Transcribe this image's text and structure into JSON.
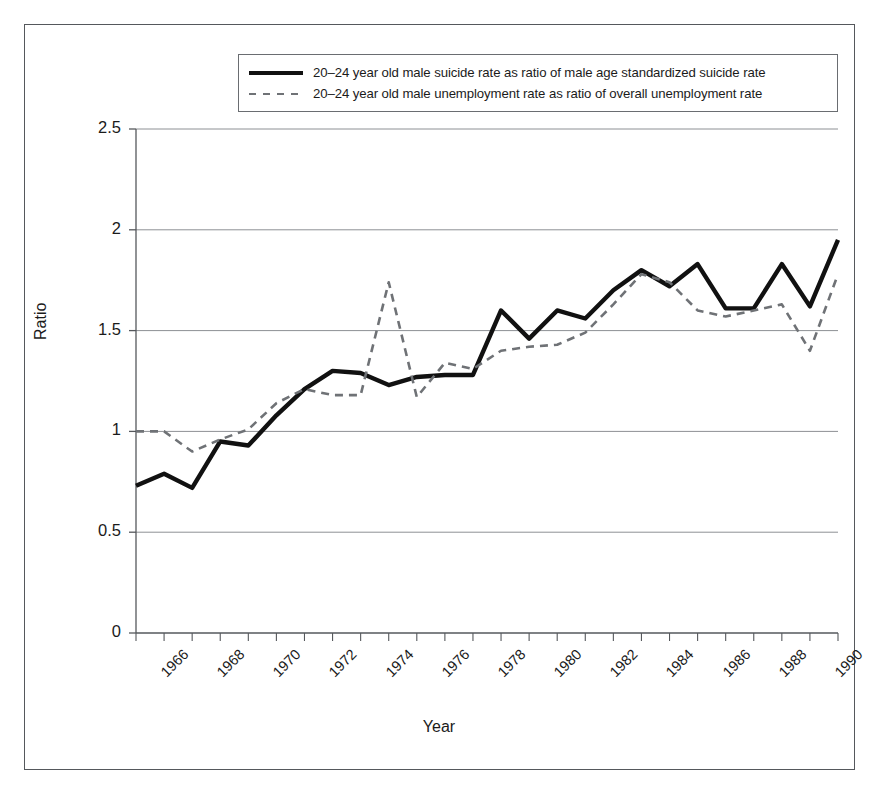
{
  "chart_data": {
    "type": "line",
    "title": "",
    "xlabel": "Year",
    "ylabel": "Ratio",
    "ylim": [
      0,
      2.5
    ],
    "xlim": [
      1966,
      1991
    ],
    "yticks": [
      "0",
      "0.5",
      "1",
      "1.5",
      "2",
      "2.5"
    ],
    "ytick_values": [
      0,
      0.5,
      1,
      1.5,
      2,
      2.5
    ],
    "xticks": [
      "1966",
      "1968",
      "1970",
      "1972",
      "1974",
      "1976",
      "1978",
      "1980",
      "1982",
      "1984",
      "1986",
      "1988",
      "1990"
    ],
    "xtick_values": [
      1966,
      1968,
      1970,
      1972,
      1974,
      1976,
      1978,
      1980,
      1982,
      1984,
      1986,
      1988,
      1990
    ],
    "grid": "horizontal",
    "legend_position": "top-center",
    "x": [
      1966,
      1967,
      1968,
      1969,
      1970,
      1971,
      1972,
      1973,
      1974,
      1975,
      1976,
      1977,
      1978,
      1979,
      1980,
      1981,
      1982,
      1983,
      1984,
      1985,
      1986,
      1987,
      1988,
      1989,
      1990,
      1991
    ],
    "series": [
      {
        "name": "20–24 year old male suicide rate as ratio of male age standardized suicide rate",
        "style": "solid",
        "color": "#111111",
        "values": [
          0.73,
          0.79,
          0.72,
          0.95,
          0.93,
          1.08,
          1.21,
          1.3,
          1.29,
          1.23,
          1.27,
          1.28,
          1.28,
          1.6,
          1.46,
          1.6,
          1.56,
          1.7,
          1.8,
          1.72,
          1.83,
          1.61,
          1.61,
          1.83,
          1.62,
          1.95
        ]
      },
      {
        "name": "20–24 year old male unemployment rate as ratio of overall unemployment rate",
        "style": "dashed",
        "color": "#6f7276",
        "values": [
          1.0,
          1.0,
          0.9,
          0.96,
          1.01,
          1.14,
          1.21,
          1.18,
          1.18,
          1.74,
          1.17,
          1.34,
          1.31,
          1.4,
          1.42,
          1.43,
          1.49,
          1.63,
          1.78,
          1.74,
          1.6,
          1.57,
          1.6,
          1.63,
          1.4,
          1.78
        ]
      }
    ]
  },
  "legend": {
    "items": [
      {
        "label": "20–24 year old male suicide rate as ratio of male age standardized suicide rate",
        "style": "solid"
      },
      {
        "label": "20–24 year old male unemployment rate as ratio of overall unemployment rate",
        "style": "dashed"
      }
    ]
  },
  "axes": {
    "y_title": "Ratio",
    "x_title": "Year"
  },
  "colors": {
    "series_solid": "#111111",
    "series_dashed": "#6f7276",
    "grid": "#8d9094",
    "axis": "#55585c",
    "frame": "#55585c",
    "text": "#1b1b1b"
  }
}
